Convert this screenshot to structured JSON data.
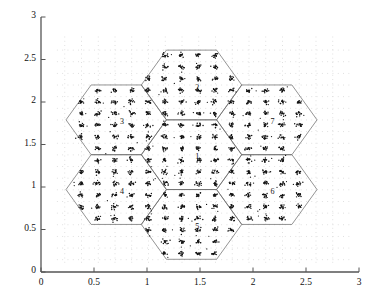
{
  "figure": {
    "type": "scatter",
    "title": "",
    "background_color": "#ffffff",
    "axis_color": "#555555",
    "grid_color": "#d9d9d9",
    "hexagon_color": "#666666",
    "point_color": "#111111"
  },
  "chart_data": {
    "type": "scatter",
    "title": "",
    "xlabel": "",
    "ylabel": "",
    "xlim": [
      0,
      3
    ],
    "ylim": [
      0,
      3
    ],
    "grid": true,
    "grid_style": "dotted",
    "legend": null,
    "xticks": [
      0,
      0.5,
      1,
      1.5,
      2,
      2.5,
      3
    ],
    "xticklabels": [
      "0",
      "0.5",
      "1",
      "1.5",
      "2",
      "2.5",
      "3"
    ],
    "yticks": [
      0,
      0.5,
      1,
      1.5,
      2,
      2.5,
      3
    ],
    "yticklabels": [
      "0",
      "0.5",
      "1",
      "1.5",
      "2",
      "2.5",
      "3"
    ],
    "cells": [
      {
        "label": "1",
        "cx": 1.42,
        "cy": 1.38,
        "label_x": 1.455,
        "label_y": 1.33
      },
      {
        "label": "2",
        "cx": 1.42,
        "cy": 2.2,
        "label_x": 1.455,
        "label_y": 2.145
      },
      {
        "label": "3",
        "cx": 0.71,
        "cy": 1.79,
        "label_x": 0.745,
        "label_y": 1.74
      },
      {
        "label": "4",
        "cx": 0.71,
        "cy": 0.97,
        "label_x": 0.745,
        "label_y": 0.92
      },
      {
        "label": "5",
        "cx": 1.42,
        "cy": 0.56,
        "label_x": 1.455,
        "label_y": 0.51
      },
      {
        "label": "6",
        "cx": 2.13,
        "cy": 0.97,
        "label_x": 2.165,
        "label_y": 0.92
      },
      {
        "label": "7",
        "cx": 2.13,
        "cy": 1.79,
        "label_x": 2.165,
        "label_y": 1.74
      }
    ],
    "hex_radius": 0.474,
    "hex_orientation": "flat-top",
    "cluster_lattice": {
      "spacing_x": 0.158,
      "spacing_y": 0.137,
      "points_per_cluster": 14,
      "cluster_sigma": 0.014,
      "stray_points_per_cluster": 1.2
    },
    "series": [
      {
        "name": "user clusters",
        "marker": ".",
        "color": "#111111",
        "size": 1.4
      }
    ]
  }
}
